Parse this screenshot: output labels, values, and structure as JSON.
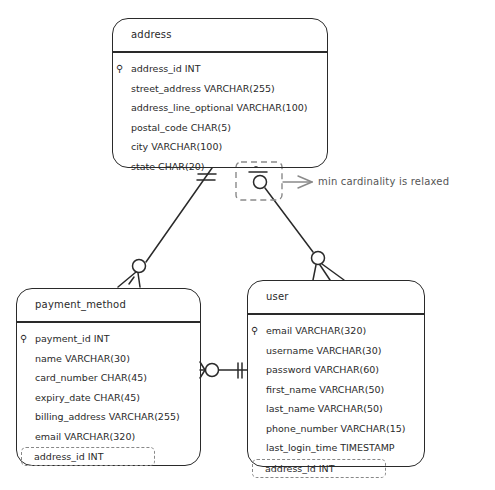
{
  "entities": {
    "address": {
      "title": "address",
      "primary_key": "address_id INT",
      "fields": [
        "street_address VARCHAR(255)",
        "address_line_optional VARCHAR(100)",
        "postal_code CHAR(5)",
        "city VARCHAR(100)",
        "state CHAR(20)"
      ]
    },
    "payment_method": {
      "title": "payment_method",
      "primary_key": "payment_id INT",
      "fields": [
        "name VARCHAR(30)",
        "card_number CHAR(45)",
        "expiry_date CHAR(45)",
        "billing_address VARCHAR(255)",
        "email VARCHAR(320)"
      ],
      "foreign_key": "address_id INT"
    },
    "user": {
      "title": "user",
      "primary_key": "email VARCHAR(320)",
      "fields": [
        "username VARCHAR(30)",
        "password VARCHAR(60)",
        "first_name VARCHAR(50)",
        "last_name VARCHAR(50)",
        "phone_number VARCHAR(15)",
        "last_login_time TIMESTAMP"
      ],
      "foreign_key": "address_id INT"
    }
  },
  "annotation": {
    "text": "min cardinality is relaxed"
  },
  "relationships": [
    {
      "from": "address",
      "to": "payment_method",
      "from_end": "one-and-only-one",
      "to_end": "zero-or-many"
    },
    {
      "from": "address",
      "to": "user",
      "from_end": "zero-or-one",
      "to_end": "zero-or-many"
    },
    {
      "from": "user",
      "to": "payment_method",
      "from_end": "one-and-only-one",
      "to_end": "zero-or-many"
    }
  ],
  "icons": {
    "primary_key": "key-icon"
  }
}
